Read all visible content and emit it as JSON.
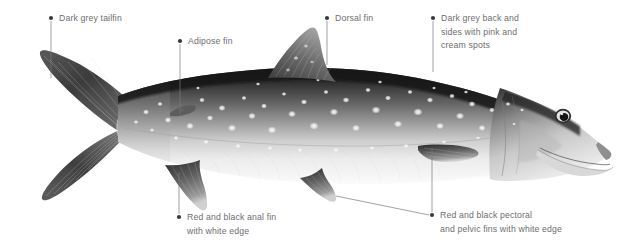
{
  "figure": {
    "background_color": "#ffffff",
    "label_text_color": "#6e6e6e",
    "leader_line_color": "#7a7a7a",
    "bullet_color": "#3a3a3a",
    "fish": {
      "body_dark_color": "#2b2b2b",
      "body_mid_color": "#8e8e8e",
      "body_belly_color": "#f2f2f2",
      "fin_dark_color": "#4a4a4a",
      "spot_color": "#eeeeea",
      "eye_color": "#1a1a1a",
      "orientation": "head-right"
    }
  },
  "callouts": [
    {
      "id": "tailfin",
      "name": "callout-dark-grey-tailfin",
      "text": "Dark grey tailfin",
      "bullet": {
        "x": 51,
        "y": 18
      },
      "text_x": 59,
      "text_y": 12,
      "leader": [
        {
          "x": 51,
          "y": 21
        },
        {
          "x": 51,
          "y": 78
        }
      ]
    },
    {
      "id": "adipose",
      "name": "callout-adipose-fin",
      "text": "Adipose fin",
      "bullet": {
        "x": 180,
        "y": 41
      },
      "text_x": 188,
      "text_y": 35,
      "leader": [
        {
          "x": 180,
          "y": 44
        },
        {
          "x": 180,
          "y": 114
        }
      ]
    },
    {
      "id": "dorsal",
      "name": "callout-dorsal-fin",
      "text": "Dorsal fin",
      "bullet": {
        "x": 327,
        "y": 18
      },
      "text_x": 335,
      "text_y": 12,
      "leader": [
        {
          "x": 327,
          "y": 21
        },
        {
          "x": 327,
          "y": 65
        }
      ]
    },
    {
      "id": "back",
      "name": "callout-dark-grey-back",
      "text": "Dark grey back and\nsides with pink and\ncream spots",
      "bullet": {
        "x": 433,
        "y": 18
      },
      "text_x": 441,
      "text_y": 12,
      "leader": [
        {
          "x": 433,
          "y": 21
        },
        {
          "x": 433,
          "y": 72
        }
      ]
    },
    {
      "id": "anal",
      "name": "callout-anal-fin",
      "text": "Red and black anal fin\nwith white edge",
      "bullet": {
        "x": 179,
        "y": 217
      },
      "text_x": 187,
      "text_y": 211,
      "leader": [
        {
          "x": 179,
          "y": 214
        },
        {
          "x": 179,
          "y": 172
        }
      ]
    },
    {
      "id": "pectoral",
      "name": "callout-pectoral-pelvic-fins",
      "text": "Red and black pectoral\nand pelvic fins with white edge",
      "bullet": {
        "x": 432,
        "y": 215
      },
      "text_x": 440,
      "text_y": 209,
      "leader": [
        {
          "x": 432,
          "y": 212
        },
        {
          "x": 432,
          "y": 148
        }
      ],
      "leader2": [
        {
          "x": 429,
          "y": 215
        },
        {
          "x": 336,
          "y": 196
        }
      ]
    }
  ]
}
